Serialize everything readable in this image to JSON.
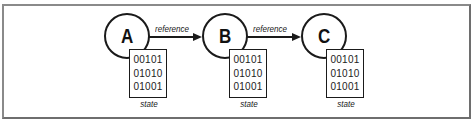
{
  "diagram": {
    "nodes": [
      {
        "id": "A",
        "label": "A",
        "state": [
          "00101",
          "01010",
          "01001"
        ],
        "state_caption": "state"
      },
      {
        "id": "B",
        "label": "B",
        "state": [
          "00101",
          "01010",
          "01001"
        ],
        "state_caption": "state"
      },
      {
        "id": "C",
        "label": "C",
        "state": [
          "00101",
          "01010",
          "01001"
        ],
        "state_caption": "state"
      }
    ],
    "edges": [
      {
        "from": "A",
        "to": "B",
        "label": "reference"
      },
      {
        "from": "B",
        "to": "C",
        "label": "reference"
      }
    ],
    "colors": {
      "stroke": "#1a1a1a",
      "frame": "#7a7a7a",
      "background": "#ffffff"
    }
  }
}
